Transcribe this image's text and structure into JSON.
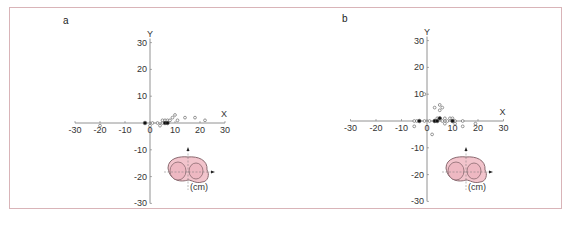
{
  "figure": {
    "border_color": "#d9b4b8",
    "panels": [
      "a",
      "b"
    ]
  },
  "chart_data": [
    {
      "type": "scatter",
      "panel_label": "a",
      "xlabel": "X",
      "ylabel": "Y",
      "unit": "(cm)",
      "xlim": [
        -30,
        30
      ],
      "ylim": [
        -30,
        30
      ],
      "x_ticks": [
        "-30",
        "-20",
        "-10",
        "0",
        "10",
        "20",
        "30"
      ],
      "y_ticks": [
        "30",
        "20",
        "10",
        "0",
        "-10",
        "-20",
        "-30"
      ],
      "grid": false,
      "series": [
        {
          "name": "open",
          "marker": "open-circle",
          "points": [
            [
              -20,
              -1
            ],
            [
              0,
              -1
            ],
            [
              1,
              0
            ],
            [
              3,
              0
            ],
            [
              4,
              -1
            ],
            [
              5,
              0
            ],
            [
              5,
              1
            ],
            [
              6,
              1
            ],
            [
              7,
              1
            ],
            [
              8,
              1
            ],
            [
              9,
              2
            ],
            [
              10,
              3
            ],
            [
              11,
              1
            ],
            [
              14,
              2
            ],
            [
              18,
              2
            ],
            [
              22,
              1
            ]
          ]
        },
        {
          "name": "filled",
          "marker": "filled-circle",
          "points": [
            [
              6,
              0
            ],
            [
              7,
              0
            ],
            [
              -2,
              0
            ]
          ]
        }
      ]
    },
    {
      "type": "scatter",
      "panel_label": "b",
      "xlabel": "X",
      "ylabel": "Y",
      "unit": "(cm)",
      "xlim": [
        -30,
        30
      ],
      "ylim": [
        -30,
        30
      ],
      "x_ticks": [
        "-30",
        "-20",
        "-10",
        "0",
        "10",
        "20",
        "30"
      ],
      "y_ticks": [
        "30",
        "20",
        "10",
        "0",
        "-10",
        "-20",
        "-30"
      ],
      "grid": false,
      "series": [
        {
          "name": "open",
          "marker": "open-circle",
          "points": [
            [
              -1,
              10
            ],
            [
              -5,
              0
            ],
            [
              -5,
              -2
            ],
            [
              -4,
              0
            ],
            [
              -1,
              0
            ],
            [
              1,
              0
            ],
            [
              2,
              -5
            ],
            [
              3,
              0
            ],
            [
              3,
              5
            ],
            [
              4,
              1
            ],
            [
              5,
              4
            ],
            [
              5,
              6
            ],
            [
              6,
              5
            ],
            [
              6,
              0
            ],
            [
              7,
              -1
            ],
            [
              7,
              1
            ],
            [
              8,
              0
            ],
            [
              9,
              1
            ],
            [
              10,
              1
            ],
            [
              11,
              0
            ],
            [
              11,
              -1
            ],
            [
              14,
              0
            ],
            [
              14,
              -2
            ],
            [
              19,
              -1
            ]
          ]
        },
        {
          "name": "filled",
          "marker": "filled-circle",
          "points": [
            [
              -3,
              0
            ],
            [
              3,
              0
            ],
            [
              4,
              0
            ],
            [
              5,
              1
            ],
            [
              10,
              0
            ]
          ]
        }
      ]
    }
  ],
  "inset": {
    "shape": "tibial-plateau",
    "fill": "#f2c4cc",
    "stroke": "#8a6a70"
  }
}
